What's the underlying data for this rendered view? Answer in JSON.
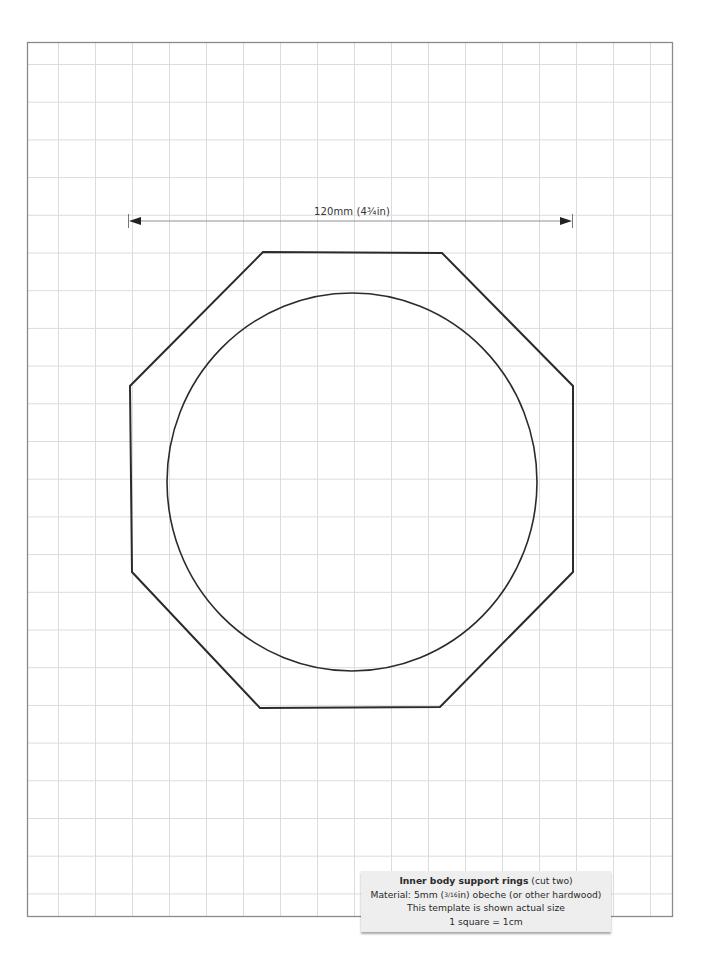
{
  "colors": {
    "grid": "#dcdcdc",
    "border": "#8a8a8a",
    "outline": "#2b2b2b",
    "caption_bg": "#eeeeee"
  },
  "grid": {
    "unit": "1cm",
    "columns": 17,
    "rows": 23
  },
  "dimension": {
    "label": "120mm (4¾in)",
    "length_mm": 120,
    "arrows": "both-ends"
  },
  "template": {
    "outer_shape": "octagon",
    "inner_shape": "circle",
    "octagon_points": [
      [
        263,
        252
      ],
      [
        442,
        253
      ],
      [
        573,
        386
      ],
      [
        573,
        572
      ],
      [
        440,
        707
      ],
      [
        260,
        708
      ],
      [
        132,
        572
      ],
      [
        130,
        386
      ]
    ],
    "circle": {
      "cx": 352,
      "cy": 482,
      "rx": 185,
      "ry": 189
    }
  },
  "caption": {
    "title_bold": "Inner body support rings",
    "title_rest": " (cut two)",
    "material_prefix": "Material:  5mm (",
    "material_fraction": "3/16",
    "material_suffix": "in) obeche (or other hardwood)",
    "scale_note": "This template is shown actual size",
    "grid_note": "1 square = 1cm"
  }
}
